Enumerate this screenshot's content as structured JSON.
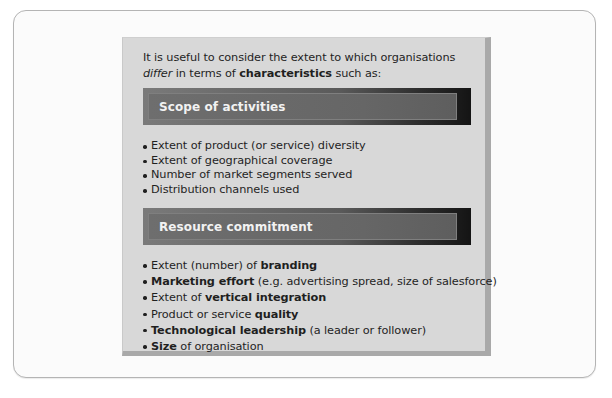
{
  "intro": {
    "part1": "It is useful to consider the extent to which organisations ",
    "italic": "differ",
    "part2": " in terms of ",
    "bold": "characteristics",
    "part3": " such as:"
  },
  "sections": [
    {
      "header": "Scope of activities",
      "items": [
        {
          "pre": "Extent of product (or service) diversity",
          "bold": "",
          "post": ""
        },
        {
          "pre": "Extent of geographical coverage",
          "bold": "",
          "post": ""
        },
        {
          "pre": "Number of market segments served",
          "bold": "",
          "post": ""
        },
        {
          "pre": "Distribution channels used",
          "bold": "",
          "post": ""
        }
      ]
    },
    {
      "header": "Resource commitment",
      "items": [
        {
          "pre": "Extent (number) of ",
          "bold": "branding",
          "post": ""
        },
        {
          "pre": "",
          "bold": "Marketing effort",
          "post": " (e.g. advertising spread, size of salesforce)"
        },
        {
          "pre": "Extent of ",
          "bold": "vertical integration",
          "post": ""
        },
        {
          "pre": "Product or service ",
          "bold": "quality",
          "post": ""
        },
        {
          "pre": "",
          "bold": "Technological leadership",
          "post": " (a leader or follower)"
        },
        {
          "pre": "",
          "bold": "Size",
          "post": " of organisation"
        }
      ]
    }
  ],
  "colors": {
    "panel_bg": "#d8d8d8",
    "panel_shadow": "#a9a9a9",
    "header_bg_start": "#7a7a7a",
    "header_bg_end": "#141414",
    "header_text": "#f2f2f2",
    "body_text": "#1f1f1f"
  }
}
